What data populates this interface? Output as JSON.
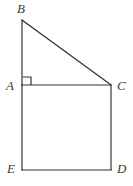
{
  "figure": {
    "kind": "geometry-diagram",
    "background_color": "#ffffff",
    "stroke_color": "#333333",
    "label_color": "#3a3a3a",
    "stroke_width": 1.2,
    "vertices": [
      {
        "id": "B",
        "label": "B",
        "x": 22,
        "y": 20
      },
      {
        "id": "A",
        "label": "A",
        "x": 22,
        "y": 85
      },
      {
        "id": "C",
        "label": "C",
        "x": 111,
        "y": 85
      },
      {
        "id": "D",
        "label": "D",
        "x": 111,
        "y": 170
      },
      {
        "id": "E",
        "label": "E",
        "x": 22,
        "y": 170
      }
    ],
    "segments": [
      {
        "id": "BA",
        "from": "B",
        "to": "A",
        "x1": 22,
        "y1": 20,
        "x2": 22,
        "y2": 85
      },
      {
        "id": "BC",
        "from": "B",
        "to": "C",
        "x1": 22,
        "y1": 20,
        "x2": 111,
        "y2": 85
      },
      {
        "id": "AC",
        "from": "A",
        "to": "C",
        "x1": 22,
        "y1": 85,
        "x2": 111,
        "y2": 85
      },
      {
        "id": "AE",
        "from": "A",
        "to": "E",
        "x1": 22,
        "y1": 85,
        "x2": 22,
        "y2": 170
      },
      {
        "id": "CD",
        "from": "C",
        "to": "D",
        "x1": 111,
        "y1": 85,
        "x2": 111,
        "y2": 170
      },
      {
        "id": "ED",
        "from": "E",
        "to": "D",
        "x1": 22,
        "y1": 170,
        "x2": 111,
        "y2": 170
      }
    ],
    "right_angle_marker": {
      "at_vertex": "A",
      "between": "BA and AC",
      "x": 23,
      "y": 77,
      "size": 8
    }
  }
}
